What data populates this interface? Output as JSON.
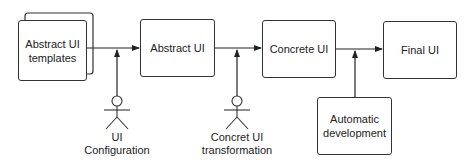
{
  "diagram": {
    "nodes": {
      "abstract_templates": "Abstract UI templates",
      "abstract_ui": "Abstract UI",
      "concrete_ui": "Concrete UI",
      "final_ui": "Final UI",
      "automatic_development": "Automatic development"
    },
    "actors": {
      "ui_configuration": "UI Configuration",
      "concrete_transformation": "Concret UI transformation"
    },
    "edges": [
      {
        "from": "Abstract UI templates",
        "to": "Abstract UI",
        "influenced_by": "UI Configuration"
      },
      {
        "from": "Abstract UI",
        "to": "Concrete UI",
        "influenced_by": "Concret UI transformation"
      },
      {
        "from": "Concrete UI",
        "to": "Final UI",
        "influenced_by": "Automatic development"
      }
    ],
    "colors": {
      "stroke": "#333333",
      "background": "#ffffff",
      "text": "#222222"
    }
  }
}
